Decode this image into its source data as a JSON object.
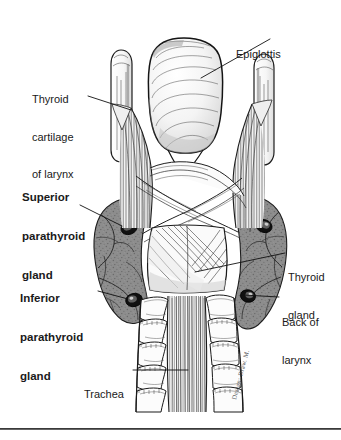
{
  "figure": {
    "background_color": "#ffffff",
    "ink_color": "#1a1a1a",
    "gland_fill_color": "#8a8a8a",
    "parathyroid_color": "#141414",
    "width": 341,
    "height": 440
  },
  "labels": {
    "epiglottis": {
      "text": "Epiglottis",
      "weight": "regular",
      "lines": [
        "Epiglottis"
      ]
    },
    "thyroid_cartilage": {
      "text": "Thyroid cartilage of larynx",
      "weight": "regular",
      "lines": [
        "Thyroid",
        "cartilage",
        "of larynx"
      ]
    },
    "superior_parathyroid": {
      "text": "Superior parathyroid gland",
      "weight": "bold",
      "lines": [
        "Superior",
        "parathyroid",
        "gland"
      ]
    },
    "inferior_parathyroid": {
      "text": "Inferior parathyroid gland",
      "weight": "bold",
      "lines": [
        "Inferior",
        "parathyroid",
        "gland"
      ]
    },
    "thyroid_gland": {
      "text": "Thyroid gland",
      "weight": "regular",
      "lines": [
        "Thyroid",
        "gland"
      ]
    },
    "back_of_larynx": {
      "text": "Back of larynx",
      "weight": "regular",
      "lines": [
        "Back of",
        "larynx"
      ]
    },
    "trachea": {
      "text": "Trachea",
      "weight": "regular",
      "lines": [
        "Trachea"
      ]
    }
  },
  "credit": {
    "signature": "artist signature"
  }
}
